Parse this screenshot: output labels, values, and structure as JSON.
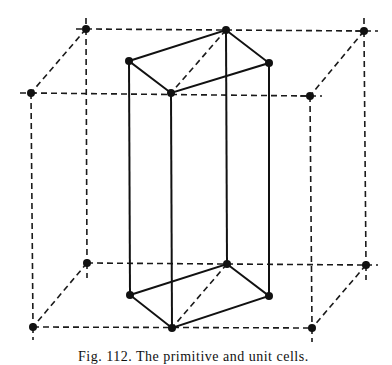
{
  "figure": {
    "outer_cell": {
      "style": "dashed",
      "vertices": {
        "btl": [
          86,
          29
        ],
        "btr": [
          364,
          31
        ],
        "ftl": [
          31,
          93
        ],
        "ftr": [
          310,
          96
        ],
        "bbl": [
          87,
          263
        ],
        "bbr": [
          366,
          265
        ],
        "fbl": [
          33,
          327
        ],
        "fbr": [
          312,
          328
        ]
      }
    },
    "inner_cell": {
      "style": "solid",
      "vertices": {
        "t1": [
          129,
          61
        ],
        "t2": [
          226,
          30
        ],
        "t3": [
          269,
          63
        ],
        "t4": [
          171,
          93
        ],
        "b1": [
          130,
          295
        ],
        "b2": [
          227,
          264
        ],
        "b3": [
          269,
          296
        ],
        "b4": [
          172,
          328
        ]
      }
    }
  },
  "caption": {
    "text": "Fig. 112. The primitive and unit cells."
  }
}
